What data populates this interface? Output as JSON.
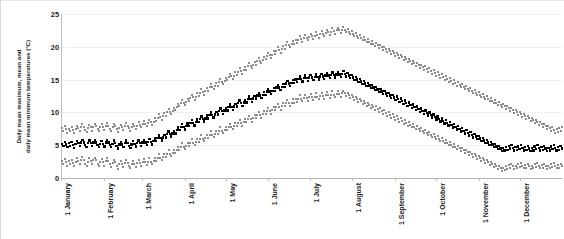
{
  "chart_data": {
    "type": "scatter",
    "title": "",
    "xlabel": "",
    "ylabel": "Daily mean maximum, mean and daily mean minimum temperatures (°C)",
    "ylabel_lines": [
      "Daily mean maximum, mean and",
      "daily mean minimum temperatures (°C)"
    ],
    "ylim": [
      0,
      25
    ],
    "yticks": [
      0,
      5,
      10,
      15,
      20,
      25
    ],
    "ytick_labels": [
      "0",
      "5",
      "10",
      "15",
      "20",
      "25"
    ],
    "grid": true,
    "legend": "none",
    "xtick_labels": [
      "1 January",
      "1 February",
      "1 March",
      "1 April",
      "1 May",
      "1 June",
      "1 July",
      "1 August",
      "1 September",
      "1 October",
      "1 November",
      "1 December"
    ],
    "xtick_days": [
      1,
      32,
      60,
      91,
      121,
      152,
      182,
      213,
      244,
      274,
      305,
      335
    ],
    "x_range_days": [
      1,
      365
    ],
    "colors": {
      "max": "#8c8c8c",
      "mean": "#000000",
      "min": "#8c8c8c",
      "grid": "#f0f0f0",
      "axis": "#b5b5b5"
    },
    "series": [
      {
        "name": "Daily mean maximum temperature",
        "color": "#8c8c8c",
        "values": [
          7.6,
          7.2,
          7.9,
          7.4,
          6.9,
          7.5,
          7.1,
          7.8,
          7.3,
          6.8,
          7.4,
          7.9,
          7.6,
          7.1,
          7.7,
          8.2,
          7.8,
          7.3,
          7.0,
          7.6,
          8.1,
          7.7,
          7.2,
          7.8,
          8.3,
          7.9,
          7.4,
          7.1,
          7.7,
          8.2,
          7.8,
          7.3,
          7.9,
          8.4,
          8.0,
          7.5,
          7.2,
          7.8,
          8.3,
          7.9,
          7.4,
          7.0,
          7.6,
          8.1,
          7.7,
          7.3,
          7.9,
          8.4,
          8.0,
          7.6,
          7.2,
          7.8,
          8.3,
          7.9,
          7.5,
          8.0,
          8.5,
          8.1,
          7.7,
          8.2,
          8.7,
          8.3,
          7.9,
          8.4,
          8.9,
          8.5,
          8.1,
          8.6,
          9.1,
          8.7,
          9.2,
          9.7,
          9.3,
          8.9,
          9.4,
          9.9,
          9.5,
          10.0,
          10.5,
          10.1,
          9.7,
          10.2,
          10.7,
          10.3,
          10.8,
          11.3,
          10.9,
          11.4,
          11.9,
          11.5,
          11.1,
          11.6,
          12.1,
          11.7,
          12.2,
          12.7,
          12.3,
          11.9,
          12.4,
          12.9,
          12.5,
          13.0,
          13.5,
          13.1,
          12.7,
          13.2,
          13.7,
          13.3,
          13.8,
          14.3,
          13.9,
          13.5,
          14.0,
          14.5,
          14.1,
          14.6,
          15.1,
          14.7,
          14.3,
          14.8,
          15.3,
          14.9,
          15.4,
          15.9,
          15.5,
          15.1,
          15.6,
          16.1,
          15.7,
          16.2,
          16.7,
          16.3,
          15.9,
          16.4,
          16.9,
          16.5,
          17.0,
          17.5,
          17.1,
          16.7,
          17.2,
          17.7,
          17.3,
          17.8,
          18.3,
          17.9,
          17.5,
          18.0,
          18.5,
          18.1,
          18.6,
          19.1,
          18.7,
          18.3,
          18.8,
          19.3,
          18.9,
          19.4,
          19.9,
          19.5,
          19.1,
          19.6,
          20.1,
          19.7,
          20.2,
          20.7,
          20.3,
          19.9,
          20.4,
          20.9,
          20.5,
          21.0,
          20.6,
          21.1,
          21.6,
          21.2,
          20.8,
          21.3,
          21.8,
          21.4,
          21.0,
          21.5,
          22.0,
          21.6,
          21.2,
          21.7,
          22.2,
          21.8,
          21.4,
          21.9,
          22.4,
          22.0,
          21.6,
          22.1,
          22.6,
          22.2,
          21.8,
          22.3,
          22.8,
          22.4,
          22.0,
          22.5,
          22.9,
          22.5,
          22.1,
          22.6,
          23.0,
          22.6,
          22.2,
          22.7,
          22.3,
          21.9,
          22.4,
          22.0,
          21.6,
          22.1,
          21.7,
          21.3,
          21.8,
          21.4,
          21.0,
          21.5,
          21.1,
          20.7,
          21.2,
          20.8,
          20.4,
          20.9,
          20.5,
          20.1,
          20.6,
          20.2,
          19.8,
          20.3,
          19.9,
          19.5,
          20.0,
          19.6,
          19.2,
          19.7,
          19.3,
          18.9,
          19.4,
          19.0,
          18.6,
          19.1,
          18.7,
          18.3,
          18.8,
          18.4,
          18.0,
          18.5,
          18.1,
          17.7,
          18.2,
          17.8,
          17.4,
          17.9,
          17.5,
          17.1,
          17.6,
          17.2,
          16.8,
          17.3,
          16.9,
          16.5,
          17.0,
          16.6,
          16.2,
          16.7,
          16.3,
          15.9,
          16.4,
          16.0,
          15.6,
          16.1,
          15.7,
          15.3,
          15.8,
          15.4,
          15.0,
          15.5,
          15.1,
          14.7,
          15.2,
          14.8,
          14.4,
          14.9,
          14.5,
          14.1,
          14.6,
          14.2,
          13.8,
          14.3,
          13.9,
          13.5,
          14.0,
          13.6,
          13.2,
          13.7,
          13.3,
          12.9,
          13.4,
          13.0,
          12.6,
          13.1,
          12.7,
          12.3,
          12.8,
          12.4,
          12.0,
          12.5,
          12.1,
          11.7,
          12.2,
          11.8,
          11.4,
          11.9,
          11.5,
          11.1,
          11.6,
          11.2,
          10.8,
          11.3,
          10.9,
          10.5,
          11.0,
          10.6,
          10.2,
          10.7,
          10.3,
          9.9,
          10.4,
          10.0,
          9.6,
          10.1,
          9.7,
          9.3,
          9.8,
          9.4,
          9.0,
          9.5,
          9.1,
          8.7,
          9.2,
          8.8,
          8.4,
          8.9,
          8.5,
          8.1,
          8.6,
          8.2,
          7.8,
          8.3,
          7.9,
          7.5,
          8.0,
          7.6,
          7.2,
          7.7,
          7.3,
          6.9,
          7.4,
          7.0,
          7.6,
          7.2,
          7.8
        ]
      },
      {
        "name": "Daily mean temperature",
        "color": "#000000",
        "values": [
          5.2,
          4.9,
          5.5,
          5.1,
          4.7,
          5.3,
          4.9,
          5.5,
          5.0,
          4.6,
          5.2,
          5.6,
          5.3,
          4.9,
          5.4,
          5.8,
          5.4,
          5.0,
          4.7,
          5.3,
          5.7,
          5.3,
          4.9,
          5.4,
          5.8,
          5.4,
          5.0,
          4.7,
          5.2,
          5.6,
          5.2,
          4.8,
          5.4,
          5.8,
          5.4,
          5.0,
          4.7,
          5.2,
          5.7,
          5.3,
          4.9,
          4.5,
          5.1,
          5.5,
          5.1,
          4.7,
          5.3,
          5.7,
          5.3,
          4.9,
          4.6,
          5.1,
          5.6,
          5.2,
          4.8,
          5.3,
          5.7,
          5.3,
          4.9,
          5.4,
          5.8,
          5.4,
          5.0,
          5.5,
          5.9,
          5.5,
          5.1,
          5.6,
          6.0,
          5.6,
          6.1,
          6.5,
          6.1,
          5.7,
          6.2,
          6.6,
          6.2,
          6.7,
          7.1,
          6.7,
          6.3,
          6.8,
          7.2,
          6.8,
          7.3,
          7.7,
          7.3,
          7.8,
          8.2,
          7.8,
          7.4,
          7.9,
          8.3,
          7.9,
          8.4,
          8.8,
          8.4,
          8.0,
          8.5,
          8.9,
          8.5,
          9.0,
          9.4,
          9.0,
          8.6,
          9.1,
          9.5,
          9.1,
          9.6,
          10.0,
          9.6,
          9.2,
          9.7,
          10.1,
          9.7,
          10.2,
          10.6,
          10.2,
          9.8,
          10.3,
          10.7,
          10.3,
          10.8,
          11.2,
          10.8,
          10.4,
          10.9,
          11.3,
          10.9,
          11.4,
          11.8,
          11.4,
          11.0,
          11.5,
          11.9,
          11.5,
          12.0,
          12.4,
          12.0,
          11.6,
          12.1,
          12.5,
          12.1,
          12.6,
          13.0,
          12.6,
          12.2,
          12.7,
          13.1,
          12.7,
          13.2,
          13.6,
          13.2,
          12.8,
          13.3,
          13.7,
          13.3,
          13.8,
          14.2,
          13.8,
          13.4,
          13.9,
          14.3,
          13.9,
          14.4,
          14.8,
          14.4,
          14.0,
          14.5,
          14.9,
          14.5,
          15.0,
          14.6,
          15.1,
          15.5,
          15.1,
          14.7,
          15.2,
          15.6,
          15.2,
          14.8,
          15.3,
          15.7,
          15.3,
          14.9,
          15.4,
          15.8,
          15.4,
          15.0,
          15.5,
          15.9,
          15.5,
          15.1,
          15.6,
          16.0,
          15.6,
          15.2,
          15.7,
          16.1,
          15.7,
          15.3,
          15.8,
          16.2,
          15.8,
          15.4,
          15.9,
          16.3,
          15.9,
          15.5,
          16.0,
          15.6,
          15.2,
          15.7,
          15.3,
          14.9,
          15.4,
          15.0,
          14.6,
          15.1,
          14.7,
          14.3,
          14.8,
          14.4,
          14.0,
          14.5,
          14.1,
          13.7,
          14.2,
          13.8,
          13.4,
          13.9,
          13.5,
          13.1,
          13.6,
          13.2,
          12.8,
          13.3,
          12.9,
          12.5,
          13.0,
          12.6,
          12.2,
          12.7,
          12.3,
          11.9,
          12.4,
          12.0,
          11.6,
          12.1,
          11.7,
          11.3,
          11.8,
          11.4,
          11.0,
          11.5,
          11.1,
          10.7,
          11.2,
          10.8,
          10.4,
          10.9,
          10.5,
          10.1,
          10.6,
          10.2,
          9.8,
          10.3,
          9.9,
          9.5,
          10.0,
          9.6,
          9.2,
          9.7,
          9.3,
          8.9,
          9.4,
          9.0,
          8.6,
          9.1,
          8.7,
          8.3,
          8.8,
          8.4,
          8.0,
          8.5,
          8.1,
          7.7,
          8.2,
          7.8,
          7.4,
          7.9,
          7.5,
          7.1,
          7.6,
          7.2,
          6.8,
          7.3,
          6.9,
          6.5,
          7.0,
          6.6,
          6.2,
          6.7,
          6.3,
          5.9,
          6.4,
          6.0,
          5.6,
          6.1,
          5.7,
          5.3,
          5.8,
          5.4,
          5.0,
          5.5,
          5.1,
          4.7,
          5.2,
          4.8,
          4.4,
          4.9,
          4.5,
          4.1,
          4.6,
          4.2,
          4.7,
          4.3,
          4.9,
          4.5,
          5.0,
          4.6,
          4.2,
          4.7,
          4.3,
          4.8,
          4.4,
          5.0,
          4.6,
          4.2,
          4.7,
          4.3,
          4.9,
          4.5,
          4.1,
          4.6,
          4.2,
          4.8,
          4.4,
          5.0,
          4.6,
          4.2,
          4.7,
          4.3,
          4.9,
          4.5,
          4.1,
          4.6,
          4.2,
          4.8,
          4.4,
          5.0,
          4.6,
          4.2,
          4.7,
          4.3,
          4.9,
          4.5
        ]
      },
      {
        "name": "Daily mean minimum temperature",
        "color": "#8c8c8c",
        "values": [
          2.6,
          2.2,
          2.9,
          2.4,
          1.9,
          2.6,
          2.1,
          2.8,
          2.3,
          1.8,
          2.5,
          3.0,
          2.6,
          2.1,
          2.7,
          3.2,
          2.7,
          2.2,
          1.8,
          2.5,
          3.0,
          2.6,
          2.1,
          2.7,
          3.1,
          2.7,
          2.2,
          1.8,
          2.4,
          2.9,
          2.4,
          1.9,
          2.6,
          3.0,
          2.6,
          2.1,
          1.7,
          2.3,
          2.8,
          2.4,
          1.9,
          1.4,
          2.1,
          2.6,
          2.1,
          1.7,
          2.3,
          2.8,
          2.3,
          1.9,
          1.5,
          2.1,
          2.6,
          2.2,
          1.7,
          2.3,
          2.8,
          2.3,
          1.9,
          2.4,
          2.9,
          2.4,
          2.0,
          2.5,
          3.0,
          2.5,
          2.1,
          2.6,
          3.1,
          2.6,
          3.1,
          3.6,
          3.1,
          2.7,
          3.2,
          3.7,
          3.2,
          3.7,
          4.2,
          3.7,
          3.3,
          3.8,
          4.3,
          3.8,
          4.3,
          4.8,
          4.3,
          4.8,
          5.3,
          4.8,
          4.4,
          4.9,
          5.4,
          4.9,
          5.4,
          5.9,
          5.4,
          5.0,
          5.5,
          6.0,
          5.5,
          6.0,
          6.5,
          6.0,
          5.6,
          6.1,
          6.6,
          6.1,
          6.6,
          7.1,
          6.6,
          6.2,
          6.7,
          7.2,
          6.7,
          7.2,
          7.7,
          7.2,
          6.8,
          7.3,
          7.8,
          7.3,
          7.8,
          8.3,
          7.8,
          7.4,
          7.9,
          8.4,
          7.9,
          8.4,
          8.9,
          8.4,
          8.0,
          8.5,
          9.0,
          8.5,
          9.0,
          9.5,
          9.0,
          8.6,
          9.1,
          9.6,
          9.1,
          9.6,
          10.1,
          9.6,
          9.2,
          9.7,
          10.2,
          9.7,
          10.2,
          10.7,
          10.2,
          9.8,
          10.3,
          10.8,
          10.3,
          10.8,
          11.3,
          10.8,
          10.4,
          10.9,
          11.4,
          10.9,
          11.4,
          11.9,
          11.4,
          11.0,
          11.5,
          12.0,
          11.5,
          12.0,
          11.6,
          12.1,
          12.6,
          12.1,
          11.7,
          12.2,
          12.7,
          12.2,
          11.8,
          12.3,
          12.8,
          12.3,
          11.9,
          12.4,
          12.9,
          12.4,
          12.0,
          12.5,
          13.0,
          12.5,
          12.1,
          12.6,
          13.1,
          12.6,
          12.2,
          12.7,
          13.2,
          12.7,
          12.3,
          12.8,
          13.2,
          12.8,
          12.4,
          12.9,
          13.3,
          12.9,
          12.5,
          13.0,
          12.6,
          12.2,
          12.7,
          12.3,
          11.9,
          12.4,
          12.0,
          11.6,
          12.1,
          11.7,
          11.3,
          11.8,
          11.4,
          11.0,
          11.5,
          11.1,
          10.7,
          11.2,
          10.8,
          10.4,
          10.9,
          10.5,
          10.1,
          10.6,
          10.2,
          9.8,
          10.3,
          9.9,
          9.5,
          10.0,
          9.6,
          9.2,
          9.7,
          9.3,
          8.9,
          9.4,
          9.0,
          8.6,
          9.1,
          8.7,
          8.3,
          8.8,
          8.4,
          8.0,
          8.5,
          8.1,
          7.7,
          8.2,
          7.8,
          7.4,
          7.9,
          7.5,
          7.1,
          7.6,
          7.2,
          6.8,
          7.3,
          6.9,
          6.5,
          7.0,
          6.6,
          6.2,
          6.7,
          6.3,
          5.9,
          6.4,
          6.0,
          5.6,
          6.1,
          5.7,
          5.3,
          5.8,
          5.4,
          5.0,
          5.5,
          5.1,
          4.7,
          5.2,
          4.8,
          4.4,
          4.9,
          4.5,
          4.1,
          4.6,
          4.2,
          3.8,
          4.3,
          3.9,
          3.5,
          4.0,
          3.6,
          3.2,
          3.7,
          3.3,
          2.9,
          3.4,
          3.0,
          2.6,
          3.1,
          2.7,
          2.3,
          2.8,
          2.4,
          2.0,
          2.5,
          2.1,
          1.7,
          2.2,
          1.8,
          1.4,
          1.9,
          1.5,
          1.1,
          1.6,
          1.2,
          1.8,
          1.4,
          2.0,
          1.6,
          2.2,
          1.8,
          1.4,
          1.9,
          1.5,
          2.1,
          1.7,
          2.3,
          1.9,
          1.5,
          2.0,
          1.6,
          2.2,
          1.8,
          1.4,
          1.9,
          1.5,
          2.1,
          1.7,
          2.3,
          1.9,
          1.5,
          2.0,
          1.6,
          2.2,
          1.8,
          1.4,
          1.9,
          1.5,
          2.1,
          1.7,
          2.3,
          1.9,
          1.5,
          2.0,
          1.6,
          2.2,
          1.8
        ]
      }
    ]
  }
}
